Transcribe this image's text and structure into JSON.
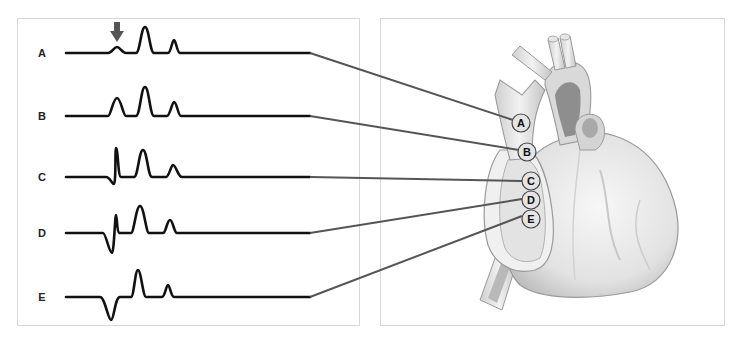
{
  "figure": {
    "type": "anatomical diagram"
  },
  "left_panel": {
    "arrow_icon": "down-arrow",
    "arrow_target": "A",
    "traces": [
      {
        "label": "A",
        "baseline_y": 53
      },
      {
        "label": "B",
        "baseline_y": 116
      },
      {
        "label": "C",
        "baseline_y": 177
      },
      {
        "label": "D",
        "baseline_y": 233
      },
      {
        "label": "E",
        "baseline_y": 297
      }
    ]
  },
  "right_panel": {
    "image": "heart-illustration",
    "sites": [
      {
        "label": "A",
        "cx": 521,
        "cy": 123
      },
      {
        "label": "B",
        "cx": 527,
        "cy": 152
      },
      {
        "label": "C",
        "cx": 531,
        "cy": 181
      },
      {
        "label": "D",
        "cx": 531,
        "cy": 201
      },
      {
        "label": "E",
        "cx": 531,
        "cy": 220
      }
    ]
  },
  "colors": {
    "trace": "#111111",
    "connector": "#555555",
    "arrow": "#555555",
    "panel_border": "#d8d8d8",
    "circle_fill": "#e4e4e4",
    "heart_fill": "#e9e9e9",
    "heart_shadow": "#a8a8a8"
  }
}
